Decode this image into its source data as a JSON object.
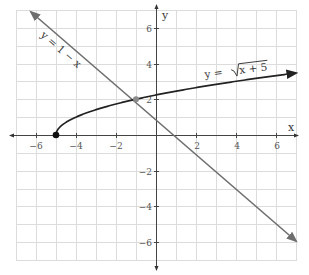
{
  "chart_data": {
    "type": "line",
    "title": "",
    "xlabel": "x",
    "ylabel": "y",
    "xlim": [
      -7,
      7
    ],
    "ylim": [
      -7,
      7
    ],
    "grid": true,
    "x_ticks": [
      -6,
      -4,
      -2,
      2,
      4,
      6
    ],
    "y_ticks": [
      6,
      4,
      2,
      -2,
      -4,
      -6
    ],
    "x_tick_labels": [
      "−6",
      "−4",
      "−2",
      "2",
      "4",
      "6"
    ],
    "y_tick_labels": [
      "6",
      "4",
      "2",
      "−2",
      "−4",
      "−6"
    ],
    "series": [
      {
        "name": "y = √(x + 5)",
        "label": "y = √x + 5",
        "function": "sqrt(x+5)",
        "color": "#222222",
        "domain": [
          -5,
          7
        ],
        "start_point": {
          "x": -5,
          "y": 0,
          "closed": true
        },
        "arrow_end": true,
        "points": [
          [
            -5,
            0
          ],
          [
            -4,
            1
          ],
          [
            -1,
            2
          ],
          [
            4,
            3
          ],
          [
            7,
            3.46
          ]
        ]
      },
      {
        "name": "y = 1 − x",
        "label": "y = 1 − x",
        "function": "1-x",
        "color": "#6e6e6e",
        "domain": [
          -6.3,
          7
        ],
        "arrow_both": true,
        "points": [
          [
            -6.3,
            7.3
          ],
          [
            -1,
            2
          ],
          [
            0,
            1
          ],
          [
            1,
            0
          ],
          [
            7,
            -6
          ]
        ]
      }
    ],
    "annotations": [
      {
        "type": "intersection",
        "x": -1,
        "y": 2,
        "color": "#8a8a8a"
      },
      {
        "type": "endpoint",
        "x": -5,
        "y": 0,
        "color": "#111111"
      }
    ]
  },
  "labels": {
    "x_axis": "x",
    "y_axis": "y",
    "curve_eq_prefix": "y = ",
    "curve_eq_radicand": "x + 5",
    "line_eq": "y = 1 − x"
  },
  "ticks": {
    "x_neg6": "−6",
    "x_neg4": "−4",
    "x_neg2": "−2",
    "x_2": "2",
    "x_4": "4",
    "x_6": "6",
    "y_6": "6",
    "y_4": "4",
    "y_2": "2",
    "y_neg2": "−2",
    "y_neg4": "−4",
    "y_neg6": "−6"
  }
}
